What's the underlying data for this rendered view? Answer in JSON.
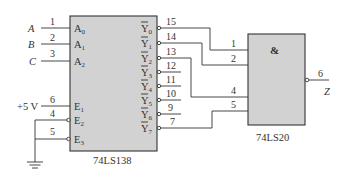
{
  "decoder": {
    "name": "74LS138",
    "inputs": [
      {
        "signal": "A",
        "pin": "1",
        "port": "A",
        "sub": "0"
      },
      {
        "signal": "B",
        "pin": "2",
        "port": "A",
        "sub": "1"
      },
      {
        "signal": "C",
        "pin": "3",
        "port": "A",
        "sub": "2"
      }
    ],
    "enables": [
      {
        "source": "+5 V",
        "pin": "6",
        "port": "E",
        "sub": "1",
        "active_low": false
      },
      {
        "source": "GND",
        "pin": "4",
        "port": "E",
        "sub": "2",
        "active_low": true
      },
      {
        "source": "GND",
        "pin": "5",
        "port": "E",
        "sub": "3",
        "active_low": true
      }
    ],
    "outputs": [
      {
        "port": "Y",
        "sub": "0",
        "pin": "15"
      },
      {
        "port": "Y",
        "sub": "1",
        "pin": "14"
      },
      {
        "port": "Y",
        "sub": "2",
        "pin": "13"
      },
      {
        "port": "Y",
        "sub": "3",
        "pin": "12"
      },
      {
        "port": "Y",
        "sub": "4",
        "pin": "11"
      },
      {
        "port": "Y",
        "sub": "5",
        "pin": "10"
      },
      {
        "port": "Y",
        "sub": "6",
        "pin": "9"
      },
      {
        "port": "Y",
        "sub": "7",
        "pin": "7"
      }
    ],
    "supply_label": "+5 V"
  },
  "gate": {
    "name": "74LS20",
    "symbol": "&",
    "input_pins": [
      "1",
      "2",
      "4",
      "5"
    ],
    "output_pin": "6",
    "output_signal": "Z"
  },
  "connections": [
    {
      "from": "Y0",
      "to": "74LS20 pin 1"
    },
    {
      "from": "Y1",
      "to": "74LS20 pin 2"
    },
    {
      "from": "Y2",
      "to": "74LS20 pin 4"
    },
    {
      "from": "Y7",
      "to": "74LS20 pin 5"
    }
  ]
}
